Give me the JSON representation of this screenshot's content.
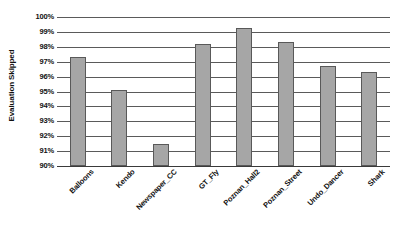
{
  "chart_data": {
    "type": "bar",
    "title": "",
    "subtitle": "",
    "xlabel": "",
    "ylabel": "Evaluation Skipped",
    "categories": [
      "Balloons",
      "Kendo",
      "Newspaper_CC",
      "GT_Fly",
      "Poznan_Hall2",
      "Poznan_Street",
      "Undo_Dancer",
      "Shark"
    ],
    "values": [
      97.35,
      95.1,
      91.5,
      98.2,
      99.25,
      98.35,
      96.7,
      96.3
    ],
    "value_unit": "%",
    "ylim": [
      90,
      100
    ],
    "ytick_step": 1,
    "ytick_labels": [
      "100%",
      "99%",
      "98%",
      "97%",
      "96%",
      "95%",
      "94%",
      "93%",
      "92%",
      "91%",
      "90%"
    ],
    "ytick_values": [
      100,
      99,
      98,
      97,
      96,
      95,
      94,
      93,
      92,
      91,
      90
    ],
    "grid": true,
    "grid_axis": "y",
    "legend": false,
    "legend_position": "none",
    "bar_fill_color": "#a6a6a6",
    "bar_border_color": "#595959",
    "gridline_color": "#5a5a5a",
    "background_color": "#ffffff",
    "xtick_rotation_degrees": 45
  }
}
